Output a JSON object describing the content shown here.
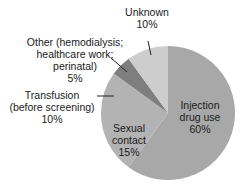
{
  "chart_data": {
    "type": "pie",
    "title": "",
    "start_angle_deg": 0,
    "direction": "clockwise",
    "slices": [
      {
        "label": "Injection drug use",
        "value": 60,
        "display": "60%",
        "color": "#a8a8a8"
      },
      {
        "label": "Sexual contact",
        "value": 15,
        "display": "15%",
        "color": "#b3b3b3"
      },
      {
        "label": "Transfusion (before screening)",
        "value": 10,
        "display": "10%",
        "color": "#b3b3b3"
      },
      {
        "label": "Other (hemodialysis; healthcare work; perinatal)",
        "value": 5,
        "display": "5%",
        "color": "#7e7e7e"
      },
      {
        "label": "Unknown",
        "value": 10,
        "display": "10%",
        "color": "#cdcdcd"
      }
    ]
  },
  "labels": {
    "injection": {
      "line1": "Injection",
      "line2": "drug use",
      "pct": "60%"
    },
    "sexual": {
      "line1": "Sexual",
      "line2": "contact",
      "pct": "15%"
    },
    "transfusion": {
      "line1": "Transfusion",
      "line2": "(before screening)",
      "pct": "10%"
    },
    "other": {
      "line1": "Other (hemodialysis;",
      "line2": "healthcare work;",
      "line3": "perinatal)",
      "pct": "5%"
    },
    "unknown": {
      "line1": "Unknown",
      "pct": "10%"
    }
  }
}
